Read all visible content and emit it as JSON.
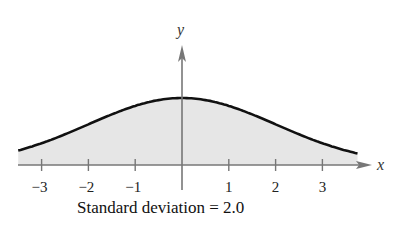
{
  "chart_data": {
    "type": "area",
    "title": "",
    "caption": "Standard deviation = 2.0",
    "xlabel": "x",
    "ylabel": "y",
    "distribution": "normal",
    "mean": 0,
    "standard_deviation": 2.0,
    "xlim": [
      -3.5,
      3.75
    ],
    "x_ticks": [
      -3,
      -2,
      -1,
      1,
      2,
      3
    ],
    "x_tick_labels": [
      "−3",
      "−2",
      "−1",
      "1",
      "2",
      "3"
    ],
    "y_ticks": [],
    "grid": false,
    "legend": null,
    "fill_color": "#e6e6e6",
    "curve_color": "#111111",
    "axis_color": "#777777"
  },
  "labels": {
    "x_axis": "x",
    "y_axis": "y",
    "caption": "Standard deviation = 2.0",
    "ticks": [
      "−3",
      "−2",
      "−1",
      "1",
      "2",
      "3"
    ]
  }
}
